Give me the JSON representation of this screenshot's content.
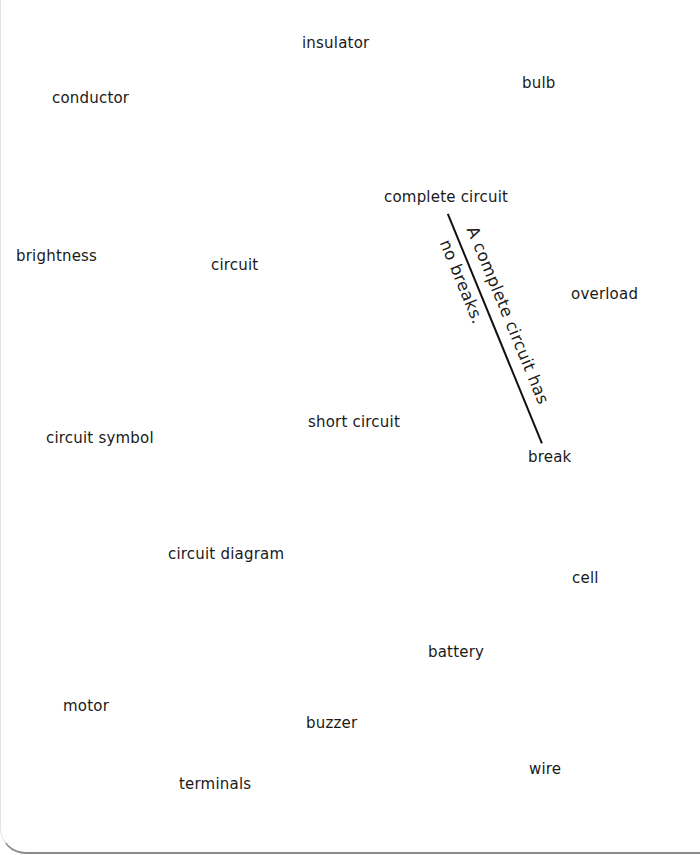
{
  "words": [
    {
      "label": "insulator",
      "x": 302,
      "y": 36
    },
    {
      "label": "bulb",
      "x": 522,
      "y": 76
    },
    {
      "label": "conductor",
      "x": 52,
      "y": 91
    },
    {
      "label": "complete circuit",
      "x": 384,
      "y": 190
    },
    {
      "label": "brightness",
      "x": 16,
      "y": 249
    },
    {
      "label": "circuit",
      "x": 211,
      "y": 258
    },
    {
      "label": "overload",
      "x": 571,
      "y": 287
    },
    {
      "label": "short circuit",
      "x": 308,
      "y": 415
    },
    {
      "label": "circuit symbol",
      "x": 46,
      "y": 431
    },
    {
      "label": "break",
      "x": 528,
      "y": 450
    },
    {
      "label": "circuit diagram",
      "x": 168,
      "y": 547
    },
    {
      "label": "cell",
      "x": 572,
      "y": 571
    },
    {
      "label": "battery",
      "x": 428,
      "y": 645
    },
    {
      "label": "motor",
      "x": 63,
      "y": 699
    },
    {
      "label": "buzzer",
      "x": 306,
      "y": 716
    },
    {
      "label": "wire",
      "x": 529,
      "y": 762
    },
    {
      "label": "terminals",
      "x": 179,
      "y": 777
    }
  ],
  "note": {
    "line1": "A complete circuit has",
    "line2": "no breaks."
  },
  "colors": {
    "text": "#1a1a1a",
    "line": "#111111",
    "background": "#ffffff"
  }
}
